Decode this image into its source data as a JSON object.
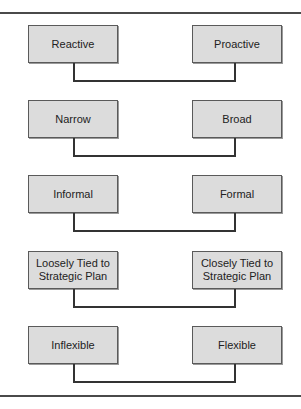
{
  "diagram": {
    "pairs": [
      {
        "left": "Reactive",
        "right": "Proactive"
      },
      {
        "left": "Narrow",
        "right": "Broad"
      },
      {
        "left": "Informal",
        "right": "Formal"
      },
      {
        "left": "Loosely Tied to Strategic Plan",
        "right": "Closely Tied to Strategic Plan"
      },
      {
        "left": "Inflexible",
        "right": "Flexible"
      }
    ]
  }
}
